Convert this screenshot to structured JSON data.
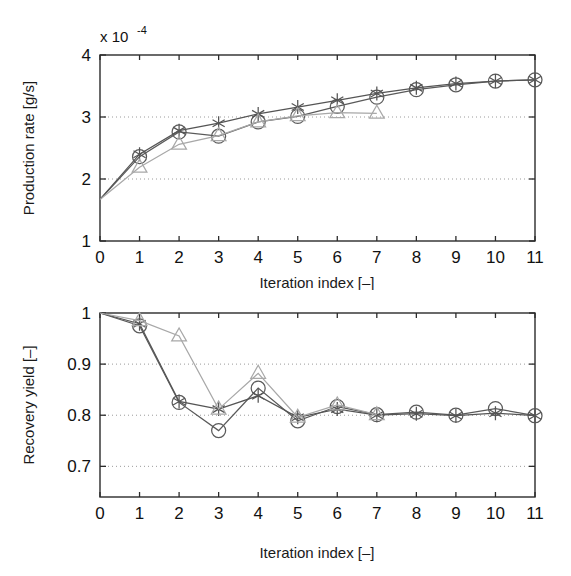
{
  "figure": {
    "title": "",
    "background": "#ffffff",
    "panel_count": 2
  },
  "colors": {
    "circle_series": "#5a5a5a",
    "star_series": "#555555",
    "triangle_series": "#a8a8a8",
    "axis": "#2b2b2b",
    "grid": "#9a9a9a",
    "text": "#111111"
  },
  "chart_data": [
    {
      "type": "line",
      "id": "production-rate",
      "title": "",
      "xlabel": "Iteration index [–]",
      "ylabel": "Production rate [g/s]",
      "y_multiplier_text": "x 10",
      "y_multiplier_exponent": "-4",
      "y_multiplier_value": 0.0001,
      "xlim": [
        0,
        11
      ],
      "ylim": [
        1,
        4
      ],
      "xticks": [
        0,
        1,
        2,
        3,
        4,
        5,
        6,
        7,
        8,
        9,
        10,
        11
      ],
      "xticklabels": [
        "0",
        "1",
        "2",
        "3",
        "4",
        "5",
        "6",
        "7",
        "8",
        "9",
        "10",
        "11"
      ],
      "yticks": [
        1,
        2,
        3,
        4
      ],
      "yticklabels": [
        "1",
        "2",
        "3",
        "4"
      ],
      "grid": true,
      "gridlines_y": [
        2,
        3
      ],
      "legend": "none",
      "series": [
        {
          "name": "circle",
          "marker": "circle",
          "color": "#5a5a5a",
          "x": [
            0,
            1,
            2,
            3,
            4,
            5,
            6,
            7,
            8,
            9,
            10,
            11
          ],
          "values": [
            1.67,
            2.36,
            2.76,
            2.69,
            2.92,
            3.01,
            3.17,
            3.32,
            3.44,
            3.52,
            3.58,
            3.6
          ]
        },
        {
          "name": "star",
          "marker": "asterisk",
          "color": "#555555",
          "x": [
            0,
            1,
            2,
            3,
            4,
            5,
            6,
            7,
            8,
            9,
            10,
            11
          ],
          "values": [
            1.67,
            2.4,
            2.78,
            2.9,
            3.05,
            3.16,
            3.27,
            3.38,
            3.47,
            3.54,
            3.58,
            3.6
          ]
        },
        {
          "name": "triangle",
          "marker": "triangle",
          "color": "#a8a8a8",
          "x": [
            0,
            1,
            2,
            3,
            4,
            5,
            6,
            7
          ],
          "values": [
            1.67,
            2.19,
            2.56,
            2.7,
            2.92,
            3.02,
            3.07,
            3.06
          ]
        }
      ]
    },
    {
      "type": "line",
      "id": "recovery-yield",
      "title": "",
      "xlabel": "Iteration index [–]",
      "ylabel": "Recovery yield [–]",
      "xlim": [
        0,
        11
      ],
      "ylim": [
        0.64,
        1.0
      ],
      "xticks": [
        0,
        1,
        2,
        3,
        4,
        5,
        6,
        7,
        8,
        9,
        10,
        11
      ],
      "xticklabels": [
        "0",
        "1",
        "2",
        "3",
        "4",
        "5",
        "6",
        "7",
        "8",
        "9",
        "10",
        "11"
      ],
      "yticks": [
        0.7,
        0.8,
        0.9,
        1.0
      ],
      "yticklabels": [
        "0.7",
        "0.8",
        "0.9",
        "1"
      ],
      "grid": true,
      "gridlines_y": [
        0.7,
        0.8,
        0.9
      ],
      "legend": "none",
      "series": [
        {
          "name": "circle",
          "marker": "circle",
          "color": "#5a5a5a",
          "x": [
            0,
            1,
            2,
            3,
            4,
            5,
            6,
            7,
            8,
            9,
            10,
            11
          ],
          "values": [
            1.0,
            0.975,
            0.825,
            0.77,
            0.853,
            0.789,
            0.817,
            0.801,
            0.806,
            0.8,
            0.813,
            0.799
          ]
        },
        {
          "name": "star",
          "marker": "asterisk",
          "color": "#555555",
          "x": [
            0,
            1,
            2,
            3,
            4,
            5,
            6,
            7,
            8,
            9,
            10,
            11
          ],
          "values": [
            1.0,
            0.979,
            0.827,
            0.812,
            0.838,
            0.796,
            0.812,
            0.8,
            0.803,
            0.799,
            0.804,
            0.799
          ]
        },
        {
          "name": "triangle",
          "marker": "triangle",
          "color": "#a8a8a8",
          "x": [
            0,
            1,
            2,
            3,
            4,
            5,
            6,
            7
          ],
          "values": [
            1.0,
            0.985,
            0.955,
            0.812,
            0.882,
            0.796,
            0.82,
            0.801
          ]
        }
      ]
    }
  ]
}
